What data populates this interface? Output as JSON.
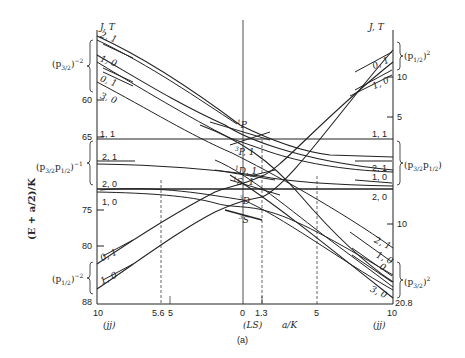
{
  "figure": {
    "caption": "(a)",
    "y_axis_label": "(E + a/2)/K",
    "x_axis_label": "a/K",
    "left_header": "J, T",
    "right_header": "J, T",
    "left_ticks": [
      {
        "value": "60",
        "y": 100
      },
      {
        "value": "65",
        "y": 137
      },
      {
        "value": "75",
        "y": 210
      },
      {
        "value": "80",
        "y": 246
      },
      {
        "value": "88",
        "y": 302
      }
    ],
    "right_ticks": [
      {
        "value": "10",
        "y": 77
      },
      {
        "value": "5",
        "y": 117
      },
      {
        "value": "10",
        "y": 224
      },
      {
        "value": "20.8",
        "y": 300
      }
    ],
    "bottom_ticks": [
      {
        "value": "10",
        "x": 97
      },
      {
        "value": "5.6",
        "x": 158
      },
      {
        "value": "5",
        "x": 171
      },
      {
        "value": "0",
        "x": 243
      },
      {
        "value": "1.3",
        "x": 262
      },
      {
        "value": "5",
        "x": 317
      },
      {
        "value": "10",
        "x": 392
      }
    ],
    "bottom_region_labels": {
      "left": "(jj)",
      "center": "(LS)",
      "right": "(jj)"
    },
    "left_groups": [
      {
        "label": "(p3/2)^-2",
        "base": "(p",
        "sub": "3/2",
        "close": ")",
        "sup": "−2"
      },
      {
        "label": "(p3/2 p1/2)^-1",
        "base": "(p",
        "sub": "3/2",
        "mid": "p",
        "sub2": "1/2",
        "close": ")",
        "sup": "−1"
      },
      {
        "label": "(p1/2)^-2",
        "base": "(p",
        "sub": "1/2",
        "close": ")",
        "sup": "−2"
      }
    ],
    "right_groups": [
      {
        "label": "(p1/2)^2",
        "base": "(p",
        "sub": "1/2",
        "close": ")",
        "sup": "2"
      },
      {
        "label": "(p3/2 p1/2)",
        "base": "(p",
        "sub": "3/2",
        "mid": "p",
        "sub2": "1/2",
        "close": ")"
      },
      {
        "label": "(p3/2)^2",
        "base": "(p",
        "sub": "3/2",
        "close": ")",
        "sup": "2"
      }
    ],
    "left_level_labels": [
      "2, 1",
      "1, 0",
      "0, 1",
      "3, 0",
      "1, 1",
      "2, 1",
      "2, 0",
      "1, 0",
      "0, 1",
      "1, 0"
    ],
    "right_level_labels": [
      "0, 1",
      "1, 0",
      "1, 1",
      "2, 1",
      "1, 0",
      "2, 0",
      "2, 1",
      "1, 0",
      "0",
      "3, 0"
    ],
    "center_term_labels": [
      {
        "text": "1P",
        "sup": "1",
        "base": "P"
      },
      {
        "text": "3P, 1",
        "sup": "3",
        "base": "P, 1"
      },
      {
        "text": "1D, 1",
        "sup": "1",
        "base": "D, 1"
      },
      {
        "text": "1S, 1",
        "sup": "1",
        "base": "S, 1"
      },
      {
        "text": "3D",
        "sup": "3",
        "base": "D"
      },
      {
        "text": "3S",
        "sup": "3",
        "base": "S"
      }
    ]
  }
}
